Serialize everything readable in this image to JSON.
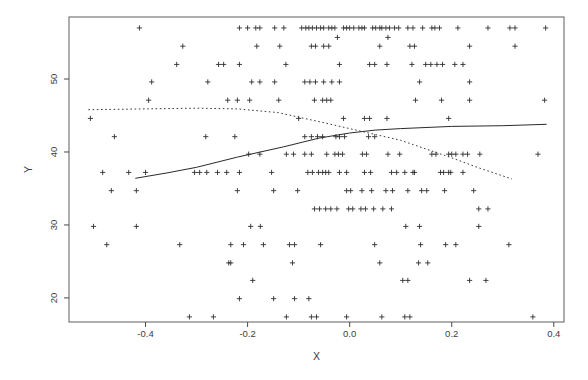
{
  "figure": {
    "background": "#ffffff",
    "box_color": "#5f5f5f",
    "tick_color": "#4a4a4a",
    "text_color": "#3c3c3c",
    "marker_color": "#303030",
    "solid_line_color": "#2a2a2a",
    "dotted_line_color": "#3a3a3a"
  },
  "chart_data": {
    "type": "scatter",
    "title": "",
    "xlabel": "X",
    "ylabel": "Y",
    "xlim": [
      -0.55,
      0.42
    ],
    "ylim": [
      16.7,
      58.5
    ],
    "grid": false,
    "legend": null,
    "marker": "plus",
    "x_ticks": [
      {
        "value": -0.4,
        "label": "-0.4"
      },
      {
        "value": -0.2,
        "label": "-0.2"
      },
      {
        "value": 0.0,
        "label": "0.0"
      },
      {
        "value": 0.2,
        "label": "0.2"
      },
      {
        "value": 0.4,
        "label": "0.4"
      }
    ],
    "y_ticks": [
      {
        "value": 20,
        "label": "20"
      },
      {
        "value": 30,
        "label": "30"
      },
      {
        "value": 40,
        "label": "40"
      },
      {
        "value": 50,
        "label": "50"
      }
    ],
    "points": [
      [
        -0.412,
        57.0
      ],
      [
        -0.216,
        57.0
      ],
      [
        -0.2,
        57.0
      ],
      [
        -0.184,
        57.0
      ],
      [
        -0.176,
        57.0
      ],
      [
        -0.147,
        57.0
      ],
      [
        -0.129,
        57.0
      ],
      [
        -0.094,
        57.0
      ],
      [
        -0.086,
        57.0
      ],
      [
        -0.08,
        57.0
      ],
      [
        -0.073,
        57.0
      ],
      [
        -0.065,
        57.0
      ],
      [
        -0.057,
        57.0
      ],
      [
        -0.051,
        57.0
      ],
      [
        -0.041,
        57.0
      ],
      [
        -0.035,
        57.0
      ],
      [
        -0.029,
        57.0
      ],
      [
        -0.012,
        57.0
      ],
      [
        -0.006,
        57.0
      ],
      [
        0.0,
        57.0
      ],
      [
        0.008,
        57.0
      ],
      [
        0.018,
        57.0
      ],
      [
        0.024,
        57.0
      ],
      [
        0.029,
        57.0
      ],
      [
        0.045,
        57.0
      ],
      [
        0.051,
        57.0
      ],
      [
        0.059,
        57.0
      ],
      [
        0.063,
        57.0
      ],
      [
        0.071,
        57.0
      ],
      [
        0.078,
        57.0
      ],
      [
        0.088,
        57.0
      ],
      [
        0.096,
        57.0
      ],
      [
        0.114,
        57.0
      ],
      [
        0.124,
        57.0
      ],
      [
        0.143,
        57.0
      ],
      [
        0.161,
        57.0
      ],
      [
        0.167,
        57.0
      ],
      [
        0.176,
        57.0
      ],
      [
        0.212,
        57.0
      ],
      [
        0.271,
        57.0
      ],
      [
        0.314,
        57.0
      ],
      [
        0.324,
        57.0
      ],
      [
        0.384,
        57.0
      ],
      [
        -0.024,
        55.7
      ],
      [
        0.075,
        55.7
      ],
      [
        -0.327,
        54.5
      ],
      [
        -0.182,
        54.5
      ],
      [
        -0.137,
        54.5
      ],
      [
        -0.075,
        54.5
      ],
      [
        -0.067,
        54.5
      ],
      [
        -0.051,
        54.5
      ],
      [
        -0.041,
        54.5
      ],
      [
        0.059,
        54.5
      ],
      [
        0.118,
        54.5
      ],
      [
        0.127,
        54.5
      ],
      [
        0.235,
        54.5
      ],
      [
        0.324,
        54.5
      ],
      [
        -0.339,
        52.0
      ],
      [
        -0.257,
        52.0
      ],
      [
        -0.247,
        52.0
      ],
      [
        -0.216,
        52.0
      ],
      [
        -0.125,
        52.0
      ],
      [
        -0.02,
        52.0
      ],
      [
        0.039,
        52.0
      ],
      [
        0.049,
        52.0
      ],
      [
        0.073,
        52.0
      ],
      [
        0.122,
        52.0
      ],
      [
        0.149,
        52.0
      ],
      [
        0.159,
        52.0
      ],
      [
        0.171,
        52.0
      ],
      [
        0.182,
        52.0
      ],
      [
        0.206,
        52.0
      ],
      [
        0.222,
        52.0
      ],
      [
        -0.388,
        49.6
      ],
      [
        -0.278,
        49.6
      ],
      [
        -0.192,
        49.6
      ],
      [
        -0.176,
        49.6
      ],
      [
        -0.147,
        49.6
      ],
      [
        -0.088,
        49.6
      ],
      [
        -0.078,
        49.6
      ],
      [
        -0.067,
        49.6
      ],
      [
        -0.051,
        49.6
      ],
      [
        -0.035,
        49.6
      ],
      [
        -0.02,
        49.6
      ],
      [
        0.137,
        49.6
      ],
      [
        0.235,
        49.6
      ],
      [
        -0.394,
        47.1
      ],
      [
        -0.239,
        47.1
      ],
      [
        -0.22,
        47.1
      ],
      [
        -0.196,
        47.1
      ],
      [
        -0.139,
        47.1
      ],
      [
        -0.069,
        47.1
      ],
      [
        -0.053,
        47.1
      ],
      [
        -0.045,
        47.1
      ],
      [
        -0.037,
        47.1
      ],
      [
        0.129,
        47.1
      ],
      [
        0.18,
        47.1
      ],
      [
        0.235,
        47.1
      ],
      [
        0.382,
        47.1
      ],
      [
        -0.508,
        44.6
      ],
      [
        -0.1,
        44.6
      ],
      [
        -0.012,
        44.6
      ],
      [
        0.029,
        44.6
      ],
      [
        0.039,
        44.6
      ],
      [
        0.073,
        44.6
      ],
      [
        0.194,
        44.6
      ],
      [
        -0.461,
        42.1
      ],
      [
        -0.282,
        42.1
      ],
      [
        -0.225,
        42.1
      ],
      [
        -0.088,
        42.1
      ],
      [
        -0.075,
        42.1
      ],
      [
        -0.063,
        42.1
      ],
      [
        -0.053,
        42.1
      ],
      [
        -0.027,
        42.1
      ],
      [
        -0.02,
        42.1
      ],
      [
        -0.01,
        42.1
      ],
      [
        0.037,
        42.1
      ],
      [
        0.049,
        42.1
      ],
      [
        -0.198,
        39.7
      ],
      [
        -0.176,
        39.7
      ],
      [
        -0.124,
        39.7
      ],
      [
        -0.11,
        39.7
      ],
      [
        -0.088,
        39.7
      ],
      [
        -0.075,
        39.7
      ],
      [
        -0.045,
        39.7
      ],
      [
        -0.029,
        39.7
      ],
      [
        -0.022,
        39.7
      ],
      [
        -0.014,
        39.7
      ],
      [
        0.025,
        39.7
      ],
      [
        0.033,
        39.7
      ],
      [
        0.075,
        39.7
      ],
      [
        0.098,
        39.7
      ],
      [
        0.161,
        39.7
      ],
      [
        0.169,
        39.7
      ],
      [
        0.194,
        39.7
      ],
      [
        0.2,
        39.7
      ],
      [
        0.208,
        39.7
      ],
      [
        0.222,
        39.7
      ],
      [
        0.231,
        39.7
      ],
      [
        0.255,
        39.7
      ],
      [
        0.369,
        39.7
      ],
      [
        -0.484,
        37.2
      ],
      [
        -0.433,
        37.2
      ],
      [
        -0.4,
        37.2
      ],
      [
        -0.304,
        37.2
      ],
      [
        -0.294,
        37.2
      ],
      [
        -0.28,
        37.2
      ],
      [
        -0.259,
        37.2
      ],
      [
        -0.241,
        37.2
      ],
      [
        -0.216,
        37.2
      ],
      [
        -0.153,
        37.2
      ],
      [
        -0.082,
        37.2
      ],
      [
        -0.073,
        37.2
      ],
      [
        -0.061,
        37.2
      ],
      [
        -0.053,
        37.2
      ],
      [
        -0.047,
        37.2
      ],
      [
        -0.041,
        37.2
      ],
      [
        -0.02,
        37.2
      ],
      [
        -0.006,
        37.2
      ],
      [
        0.029,
        37.2
      ],
      [
        0.041,
        37.2
      ],
      [
        0.082,
        37.2
      ],
      [
        0.092,
        37.2
      ],
      [
        0.108,
        37.2
      ],
      [
        0.124,
        37.2
      ],
      [
        0.127,
        37.2
      ],
      [
        0.178,
        37.2
      ],
      [
        0.184,
        37.2
      ],
      [
        0.194,
        37.2
      ],
      [
        0.198,
        37.2
      ],
      [
        0.222,
        37.2
      ],
      [
        -0.467,
        34.7
      ],
      [
        -0.418,
        34.7
      ],
      [
        -0.22,
        34.7
      ],
      [
        -0.149,
        34.7
      ],
      [
        -0.102,
        34.7
      ],
      [
        -0.006,
        34.7
      ],
      [
        0.002,
        34.7
      ],
      [
        0.024,
        34.7
      ],
      [
        0.043,
        34.7
      ],
      [
        0.071,
        34.7
      ],
      [
        0.084,
        34.7
      ],
      [
        0.114,
        34.7
      ],
      [
        0.141,
        34.7
      ],
      [
        0.151,
        34.7
      ],
      [
        0.186,
        34.7
      ],
      [
        0.243,
        34.7
      ],
      [
        -0.069,
        32.2
      ],
      [
        -0.059,
        32.2
      ],
      [
        -0.047,
        32.2
      ],
      [
        -0.037,
        32.2
      ],
      [
        -0.025,
        32.2
      ],
      [
        -0.002,
        32.2
      ],
      [
        0.006,
        32.2
      ],
      [
        0.022,
        32.2
      ],
      [
        0.031,
        32.2
      ],
      [
        0.047,
        32.2
      ],
      [
        0.065,
        32.2
      ],
      [
        0.082,
        32.2
      ],
      [
        0.253,
        32.2
      ],
      [
        0.271,
        32.2
      ],
      [
        -0.502,
        29.8
      ],
      [
        -0.418,
        29.8
      ],
      [
        -0.194,
        29.8
      ],
      [
        -0.175,
        29.8
      ],
      [
        0.11,
        29.8
      ],
      [
        0.137,
        29.8
      ],
      [
        0.253,
        29.8
      ],
      [
        -0.476,
        27.3
      ],
      [
        -0.333,
        27.3
      ],
      [
        -0.233,
        27.3
      ],
      [
        -0.208,
        27.3
      ],
      [
        -0.169,
        27.3
      ],
      [
        -0.118,
        27.3
      ],
      [
        -0.108,
        27.3
      ],
      [
        -0.057,
        27.3
      ],
      [
        0.049,
        27.3
      ],
      [
        0.139,
        27.3
      ],
      [
        0.188,
        27.3
      ],
      [
        0.208,
        27.3
      ],
      [
        0.312,
        27.3
      ],
      [
        -0.237,
        24.8
      ],
      [
        -0.233,
        24.8
      ],
      [
        -0.112,
        24.8
      ],
      [
        0.059,
        24.8
      ],
      [
        0.135,
        24.8
      ],
      [
        0.153,
        24.8
      ],
      [
        -0.19,
        22.4
      ],
      [
        0.104,
        22.4
      ],
      [
        0.114,
        22.4
      ],
      [
        0.235,
        22.4
      ],
      [
        0.267,
        22.4
      ],
      [
        -0.216,
        19.9
      ],
      [
        -0.149,
        19.9
      ],
      [
        -0.108,
        19.9
      ],
      [
        -0.08,
        19.9
      ],
      [
        -0.314,
        17.4
      ],
      [
        -0.267,
        17.4
      ],
      [
        -0.124,
        17.4
      ],
      [
        -0.075,
        17.4
      ],
      [
        -0.065,
        17.4
      ],
      [
        -0.006,
        17.4
      ],
      [
        0.063,
        17.4
      ],
      [
        0.108,
        17.4
      ],
      [
        0.118,
        17.4
      ],
      [
        0.359,
        17.4
      ]
    ],
    "curves": [
      {
        "name": "solid-fit",
        "style": "solid",
        "points": [
          [
            -0.42,
            36.4
          ],
          [
            -0.36,
            37.1
          ],
          [
            -0.3,
            37.9
          ],
          [
            -0.22,
            39.3
          ],
          [
            -0.13,
            40.7
          ],
          [
            -0.06,
            41.9
          ],
          [
            0.0,
            42.6
          ],
          [
            0.05,
            43.0
          ],
          [
            0.1,
            43.2
          ],
          [
            0.2,
            43.5
          ],
          [
            0.3,
            43.6
          ],
          [
            0.386,
            43.8
          ]
        ]
      },
      {
        "name": "dotted-fit",
        "style": "dotted",
        "points": [
          [
            -0.512,
            45.8
          ],
          [
            -0.4,
            45.9
          ],
          [
            -0.3,
            46.0
          ],
          [
            -0.22,
            45.9
          ],
          [
            -0.14,
            45.4
          ],
          [
            -0.05,
            44.0
          ],
          [
            0.0,
            43.2
          ],
          [
            0.05,
            42.4
          ],
          [
            0.1,
            41.6
          ],
          [
            0.15,
            40.4
          ],
          [
            0.2,
            39.2
          ],
          [
            0.25,
            37.9
          ],
          [
            0.318,
            36.3
          ]
        ]
      }
    ]
  }
}
